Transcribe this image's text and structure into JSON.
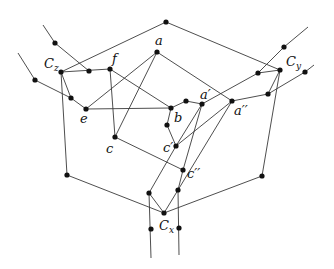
{
  "diagram": {
    "type": "graph",
    "labels": {
      "a": "a",
      "a_prime": "a′",
      "a_dprime": "a′′",
      "b": "b",
      "c": "c",
      "c_prime": "c′",
      "c_dprime": "c′′",
      "e": "e",
      "f": "f",
      "Cx": "C",
      "Cx_sub": "x",
      "Cy": "C",
      "Cy_sub": "y",
      "Cz": "C",
      "Cz_sub": "z"
    },
    "nodes": [
      {
        "id": "top",
        "x": 166,
        "y": 22
      },
      {
        "id": "a",
        "x": 157,
        "y": 52
      },
      {
        "id": "f",
        "x": 110,
        "y": 69
      },
      {
        "id": "Cz",
        "x": 61,
        "y": 72
      },
      {
        "id": "z1",
        "x": 55,
        "y": 43
      },
      {
        "id": "z2",
        "x": 89,
        "y": 71
      },
      {
        "id": "z3",
        "x": 35,
        "y": 80
      },
      {
        "id": "z4",
        "x": 71,
        "y": 98
      },
      {
        "id": "e",
        "x": 86,
        "y": 109
      },
      {
        "id": "b",
        "x": 171,
        "y": 108
      },
      {
        "id": "bb",
        "x": 186,
        "y": 101
      },
      {
        "id": "a_prime",
        "x": 202,
        "y": 104
      },
      {
        "id": "a_dprime",
        "x": 232,
        "y": 101
      },
      {
        "id": "b2",
        "x": 167,
        "y": 125
      },
      {
        "id": "c",
        "x": 115,
        "y": 137
      },
      {
        "id": "c_prime",
        "x": 176,
        "y": 146
      },
      {
        "id": "c_dprime",
        "x": 183,
        "y": 170
      },
      {
        "id": "Cy",
        "x": 280,
        "y": 70
      },
      {
        "id": "y1",
        "x": 284,
        "y": 47
      },
      {
        "id": "y2",
        "x": 258,
        "y": 73
      },
      {
        "id": "y3",
        "x": 305,
        "y": 72
      },
      {
        "id": "y4",
        "x": 268,
        "y": 94
      },
      {
        "id": "ly",
        "x": 262,
        "y": 176
      },
      {
        "id": "lz",
        "x": 67,
        "y": 175
      },
      {
        "id": "Cx",
        "x": 164,
        "y": 213
      },
      {
        "id": "x1",
        "x": 149,
        "y": 193
      },
      {
        "id": "x2",
        "x": 178,
        "y": 190
      },
      {
        "id": "x3",
        "x": 151,
        "y": 229
      },
      {
        "id": "x4",
        "x": 179,
        "y": 228
      }
    ]
  }
}
